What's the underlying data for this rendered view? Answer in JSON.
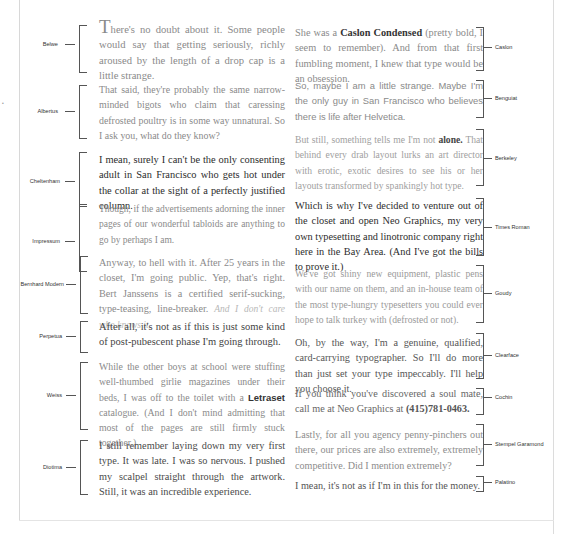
{
  "page": {
    "margin_mark": "•"
  },
  "left_column": [
    {
      "font": "Belwe",
      "text_before_cap": "",
      "drop_cap": "T",
      "text": "here's no doubt about it. Some people would say that getting seriously, richly aroused by the length of a drop cap is a little strange."
    },
    {
      "font": "Albertus",
      "text": "That said, they're probably the same narrow-minded bigots who claim that caressing defrosted poultry is in some way unnatural. So I ask you, what do they know?"
    },
    {
      "font": "Cheltenham",
      "text": "I mean, surely I can't be the only consenting adult in San Francisco who gets hot under the collar at the sight of a perfectly justified column."
    },
    {
      "font": "Impressum",
      "text": "Though, if the advertisements adorning the inner pages of our wonderful tabloids are anything to go by perhaps I am."
    },
    {
      "font": "Bernhard Modern",
      "text": "Anyway, to hell with it. After 25 years in the closet, I'm going public. Yep, that's right. Bert Janssens is a certified serif-sucking, type-teasing, line-breaker.",
      "italic_tail": "And I don't care who knows it."
    },
    {
      "font": "Perpetua",
      "text": "After all, it's not as if this is just some kind of post-pubescent phase I'm going through."
    },
    {
      "font": "Weiss",
      "text_part1": "While the other boys at school were stuffing well-thumbed girlie magazines under their beds, I was off to the toilet with a",
      "bold_word": "Letraset",
      "text_part2": "catalogue. (And I don't mind admitting that most of the pages are still firmly stuck together.)"
    },
    {
      "font": "Diotima",
      "text": "I still remember laying down my very first type. It was late. I was so nervous. I pushed my scalpel straight through the artwork. Still, it was an incredible experience."
    }
  ],
  "right_column": [
    {
      "font": "Caslon",
      "text_part1": "She was a",
      "bold_phrase": "Caslon Condensed",
      "text_part2": "(pretty bold, I seem to remember). And from that first fumbling moment, I knew that type would be an obsession."
    },
    {
      "font": "Benguiat",
      "text": "So, maybe I am a little strange. Maybe I'm the only guy in San Francisco who believes there is life after Helvetica."
    },
    {
      "font": "Berkeley",
      "text_part1": "But still, something tells me I'm not",
      "bold_word": "alone.",
      "text_part2": "That behind every drab layout lurks an art director with erotic, exotic desires to see his or her layouts transformed by spankingly hot type."
    },
    {
      "font": "Times Roman",
      "text": "Which is why I've decided to venture out of the closet and open Neo Graphics, my very own typesetting and linotronic company right here in the Bay Area. (And I've got the bills to prove it.)"
    },
    {
      "font": "Goudy",
      "text": "We've got shiny new equipment, plastic pens with our name on them, and an in-house team of the most type-hungry typesetters you could ever hope to talk turkey with (defrosted or not)."
    },
    {
      "font": "Clearface",
      "text": "Oh, by the way, I'm a genuine, qualified, card-carrying typographer. So I'll do more than just set your type impeccably. I'll help you choose it."
    },
    {
      "font": "Cochin",
      "text_part1": "If you think you've discovered a soul mate, call me at Neo Graphics at",
      "bold_phone": "(415)781-0463."
    },
    {
      "font": "Stempel Garamond",
      "text": "Lastly, for all you agency penny-pinchers out there, our prices are also extremely, extremely competitive. Did I mention extremely?"
    },
    {
      "font": "Palatino",
      "text": "I mean, it's not as if I'm in this for the money."
    }
  ]
}
